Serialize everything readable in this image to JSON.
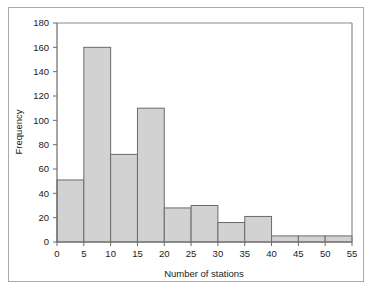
{
  "chart_data": {
    "type": "bar",
    "title": "",
    "subtitle": "",
    "xlabel": "Number of stations",
    "ylabel": "Frequency",
    "categories": [
      "0-5",
      "5-10",
      "10-15",
      "15-20",
      "20-25",
      "25-30",
      "30-35",
      "35-40",
      "40-45",
      "45-50",
      "50-55"
    ],
    "bin_edges": [
      0,
      5,
      10,
      15,
      20,
      25,
      30,
      35,
      40,
      45,
      50,
      55
    ],
    "values": [
      51,
      160,
      72,
      110,
      28,
      30,
      16,
      21,
      5,
      5,
      5
    ],
    "xlim": [
      0,
      55
    ],
    "ylim": [
      0,
      180
    ],
    "xticks": [
      0,
      5,
      10,
      15,
      20,
      25,
      30,
      35,
      40,
      45,
      50,
      55
    ],
    "yticks": [
      0,
      20,
      40,
      60,
      80,
      100,
      120,
      140,
      160,
      180
    ],
    "xtick_labels": [
      "0",
      "5",
      "10",
      "15",
      "20",
      "25",
      "30",
      "35",
      "40",
      "45",
      "50",
      "55"
    ],
    "ytick_labels": [
      "0",
      "20",
      "40",
      "60",
      "80",
      "100",
      "120",
      "140",
      "160",
      "180"
    ],
    "grid": false,
    "legend": null,
    "bar_fill_color": "#d2d2d2",
    "bar_edge_color": "#6b6b6b",
    "axis_color": "#6b6b6b",
    "text_color": "#1a1a1a",
    "frame_color": "#a9a9a9",
    "background_color": "#ffffff"
  },
  "axes": {
    "x_title": "Number of stations",
    "y_title": "Frequency"
  }
}
